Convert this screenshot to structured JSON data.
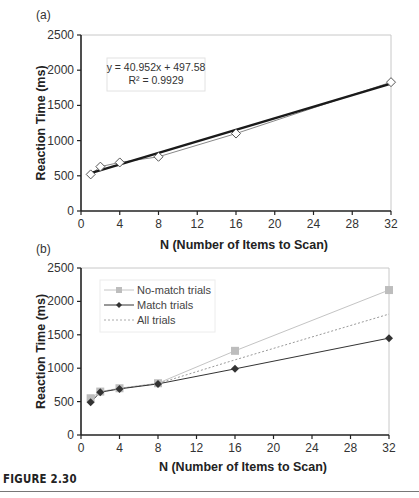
{
  "figure": {
    "caption": "FIGURE 2.30"
  },
  "chart_data": [
    {
      "panel": "(a)",
      "type": "scatter",
      "title": "",
      "xlabel": "N (Number of Items to Scan)",
      "ylabel": "Reaction Time (ms)",
      "xlim": [
        0,
        32
      ],
      "ylim": [
        0,
        2500
      ],
      "xticks": [
        0,
        4,
        8,
        12,
        16,
        20,
        24,
        28,
        32
      ],
      "yticks": [
        0,
        500,
        1000,
        1500,
        2000,
        2500
      ],
      "grid": false,
      "series": [
        {
          "name": "Data",
          "marker": "open-diamond",
          "line": "thin-gray",
          "x": [
            1,
            2,
            4,
            8,
            16,
            32
          ],
          "values": [
            520,
            630,
            690,
            770,
            1100,
            1830
          ]
        },
        {
          "name": "Linear fit",
          "line": "thick-black",
          "x": [
            1,
            32
          ],
          "values": [
            538.5,
            1808.0
          ]
        }
      ],
      "annotations": [
        "y = 40.952x + 497.58",
        "R² = 0.9929"
      ],
      "trendline": {
        "slope": 40.952,
        "intercept": 497.58,
        "r2": 0.9929
      }
    },
    {
      "panel": "(b)",
      "type": "line",
      "title": "",
      "xlabel": "N (Number of Items to Scan)",
      "ylabel": "Reaction Time (ms)",
      "xlim": [
        0,
        32
      ],
      "ylim": [
        0,
        2500
      ],
      "xticks": [
        0,
        4,
        8,
        12,
        16,
        20,
        24,
        28,
        32
      ],
      "yticks": [
        0,
        500,
        1000,
        1500,
        2000,
        2500
      ],
      "grid": false,
      "legend_position": "upper-left",
      "x": [
        1,
        2,
        4,
        8,
        16,
        32
      ],
      "series": [
        {
          "name": "No-match trials",
          "marker": "square",
          "color": "#bbbbbb",
          "values": [
            550,
            650,
            700,
            775,
            1260,
            2170
          ]
        },
        {
          "name": "Match trials",
          "marker": "diamond",
          "color": "#333333",
          "values": [
            490,
            640,
            690,
            765,
            990,
            1450
          ]
        },
        {
          "name": "All trials",
          "style": "dashed",
          "color": "#888888",
          "values": [
            520,
            645,
            695,
            770,
            1125,
            1810
          ]
        }
      ]
    }
  ],
  "labels": {
    "panel_a": "(a)",
    "panel_b": "(b)",
    "xlabel": "N (Number of Items to Scan)",
    "ylabel": "Reaction Time (ms)",
    "eq_line1": "y = 40.952x + 497.58",
    "eq_line2": "R² = 0.9929",
    "legend": [
      "No-match trials",
      "Match trials",
      "All trials"
    ],
    "xticks": [
      "0",
      "4",
      "8",
      "12",
      "16",
      "20",
      "24",
      "28",
      "32"
    ],
    "yticks": [
      "0",
      "500",
      "1000",
      "1500",
      "2000",
      "2500"
    ]
  }
}
